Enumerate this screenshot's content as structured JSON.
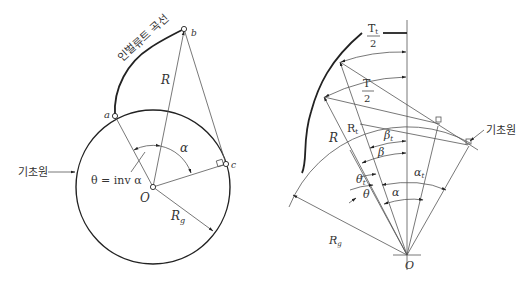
{
  "left_diagram": {
    "curve_label": "인벌류트 곡선",
    "base_circle_label": "기초원",
    "points": {
      "a": "a",
      "b": "b",
      "c": "c",
      "O": "O"
    },
    "radius_label": "R",
    "base_radius_label": "R",
    "base_radius_sub": "g",
    "alpha_label": "α",
    "theta_eq": "θ = inv α"
  },
  "right_diagram": {
    "base_circle_label": "기초원",
    "Tt_num": "T",
    "Tt_sub": "t",
    "Tt_den": "2",
    "T_num": "T",
    "T_den": "2",
    "Rt": "R",
    "Rt_sub": "t",
    "R": "R",
    "Rg": "R",
    "Rg_sub": "g",
    "beta_t": "β",
    "beta_t_sub": "t",
    "beta": "β",
    "theta_t": "θ",
    "theta_t_sub": "t",
    "theta": "θ",
    "alpha_t": "α",
    "alpha_t_sub": "t",
    "alpha": "α",
    "origin": "O"
  }
}
